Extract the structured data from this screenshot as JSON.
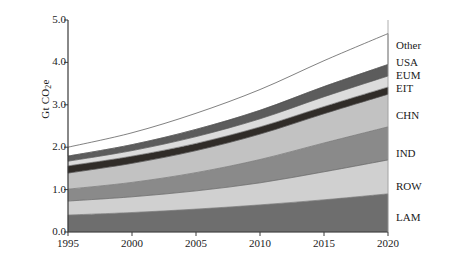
{
  "chart_data": {
    "type": "area",
    "stacked": true,
    "title": "",
    "xlabel": "",
    "ylabel": "Gt CO2e",
    "ylabel_parts": {
      "prefix": "Gt CO",
      "sub": "2",
      "suffix": "e"
    },
    "xlim": [
      1995,
      2020
    ],
    "ylim": [
      0.0,
      5.0
    ],
    "grid": false,
    "legend_position": "right-outside",
    "xticks": [
      1995,
      2000,
      2005,
      2010,
      2015,
      2020
    ],
    "xtick_labels": [
      "1995",
      "2000",
      "2005",
      "2010",
      "2015",
      "2020"
    ],
    "yticks": [
      0.0,
      1.0,
      2.0,
      3.0,
      4.0,
      5.0
    ],
    "ytick_labels": [
      "0.0",
      "1.0",
      "2.0",
      "3.0",
      "4.0",
      "5.0"
    ],
    "x": [
      1995,
      2000,
      2005,
      2010,
      2015,
      2020
    ],
    "series": [
      {
        "name": "LAM",
        "color": "#6e6e6e",
        "values": [
          0.4,
          0.46,
          0.54,
          0.64,
          0.76,
          0.9
        ]
      },
      {
        "name": "ROW",
        "color": "#d0d0d0",
        "values": [
          0.33,
          0.37,
          0.43,
          0.52,
          0.66,
          0.8
        ]
      },
      {
        "name": "IND",
        "color": "#8a8a8a",
        "values": [
          0.28,
          0.34,
          0.43,
          0.55,
          0.68,
          0.78
        ]
      },
      {
        "name": "CHN",
        "color": "#c2c2c2",
        "values": [
          0.38,
          0.45,
          0.52,
          0.6,
          0.69,
          0.77
        ]
      },
      {
        "name": "EIT",
        "color": "#302c28",
        "values": [
          0.17,
          0.17,
          0.17,
          0.17,
          0.17,
          0.17
        ]
      },
      {
        "name": "EUM",
        "color": "#dcdcdc",
        "values": [
          0.11,
          0.13,
          0.16,
          0.19,
          0.23,
          0.26
        ]
      },
      {
        "name": "USA",
        "color": "#5c5c5c",
        "values": [
          0.12,
          0.14,
          0.17,
          0.2,
          0.24,
          0.27
        ]
      },
      {
        "name": "Other",
        "color": "#ffffff",
        "values": [
          0.21,
          0.28,
          0.38,
          0.49,
          0.61,
          0.73
        ]
      }
    ],
    "cumulative_tops": {
      "LAM": [
        0.4,
        0.46,
        0.54,
        0.64,
        0.76,
        0.9
      ],
      "ROW": [
        0.73,
        0.83,
        0.97,
        1.16,
        1.42,
        1.7
      ],
      "IND": [
        1.01,
        1.17,
        1.4,
        1.71,
        2.1,
        2.48
      ],
      "CHN": [
        1.39,
        1.62,
        1.92,
        2.31,
        2.79,
        3.25
      ],
      "EIT": [
        1.56,
        1.79,
        2.09,
        2.48,
        2.96,
        3.42
      ],
      "EUM": [
        1.67,
        1.92,
        2.25,
        2.67,
        3.19,
        3.68
      ],
      "USA": [
        1.79,
        2.06,
        2.42,
        2.87,
        3.43,
        3.95
      ],
      "Other": [
        2.0,
        2.34,
        2.8,
        3.36,
        4.04,
        4.68
      ]
    },
    "legend_entries": [
      {
        "label": "Other",
        "color": "#ffffff"
      },
      {
        "label": "USA",
        "color": "#5c5c5c"
      },
      {
        "label": "EUM",
        "color": "#dcdcdc"
      },
      {
        "label": "EIT",
        "color": "#302c28"
      },
      {
        "label": "CHN",
        "color": "#c2c2c2"
      },
      {
        "label": "IND",
        "color": "#8a8a8a"
      },
      {
        "label": "ROW",
        "color": "#d0d0d0"
      },
      {
        "label": "LAM",
        "color": "#6e6e6e"
      }
    ]
  },
  "legend_positions_px": {
    "Other": 40,
    "USA": 57,
    "EUM": 70,
    "EIT": 83,
    "CHN": 110,
    "IND": 148,
    "ROW": 181,
    "LAM": 212
  },
  "axis_colors": {
    "axis_line": "#3a3a3a",
    "text": "#1a1a1a",
    "background": "#ffffff"
  }
}
